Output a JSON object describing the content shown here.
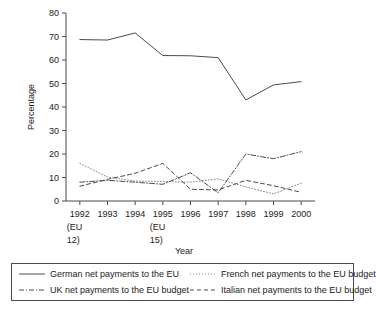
{
  "chart_data": {
    "type": "line",
    "title": "",
    "xlabel": "Year",
    "ylabel": "Percentage",
    "ylim": [
      0,
      80
    ],
    "ytick_step": 10,
    "yticks": [
      "0",
      "10",
      "20",
      "30",
      "40",
      "50",
      "60",
      "70",
      "80"
    ],
    "grid": false,
    "legend_position": "bottom",
    "x": [
      1992,
      1993,
      1994,
      1995,
      1996,
      1997,
      1998,
      1999,
      2000
    ],
    "categories": [
      "1992",
      "1993",
      "1994",
      "1995",
      "1996",
      "1997",
      "1998",
      "1999",
      "2000"
    ],
    "xtick_labels": [
      {
        "year": "1992",
        "note1": "(EU",
        "note2": "12)"
      },
      {
        "year": "1993",
        "note1": "",
        "note2": ""
      },
      {
        "year": "1994",
        "note1": "",
        "note2": ""
      },
      {
        "year": "1995",
        "note1": "(EU",
        "note2": "15)"
      },
      {
        "year": "1996",
        "note1": "",
        "note2": ""
      },
      {
        "year": "1997",
        "note1": "",
        "note2": ""
      },
      {
        "year": "1998",
        "note1": "",
        "note2": ""
      },
      {
        "year": "1999",
        "note1": "",
        "note2": ""
      },
      {
        "year": "2000",
        "note1": "",
        "note2": ""
      }
    ],
    "series": [
      {
        "name": "German net payments to the EU",
        "style": "solid",
        "color": "#4a4a4a",
        "values": [
          68.7,
          68.5,
          71.5,
          61.9,
          61.8,
          61.0,
          43.0,
          49.4,
          50.8
        ]
      },
      {
        "name": "French net payments to the EU budget",
        "style": "dotted",
        "color": "#8a8a8a",
        "values": [
          16.0,
          10.2,
          8.5,
          8.3,
          8.0,
          9.4,
          6.0,
          3.0,
          7.6
        ]
      },
      {
        "name": "UK net payments to the EU budget",
        "style": "dashdot",
        "color": "#4a4a4a",
        "values": [
          8.0,
          8.8,
          8.0,
          7.1,
          12.0,
          3.5,
          20.0,
          18.0,
          21.0
        ]
      },
      {
        "name": "Italian net payments to the EU budget",
        "style": "dashed",
        "color": "#4a4a4a",
        "values": [
          6.3,
          9.2,
          11.8,
          16.0,
          5.0,
          4.7,
          8.8,
          6.5,
          3.7
        ]
      }
    ]
  },
  "legend": {
    "entries": [
      {
        "label": "German net payments to the EU"
      },
      {
        "label": "French net payments to the EU budget"
      },
      {
        "label": "UK net payments to the EU budget"
      },
      {
        "label": "Italian net payments to the EU budget"
      }
    ]
  },
  "axes": {
    "ylabel": "Percentage",
    "xlabel": "Year"
  }
}
